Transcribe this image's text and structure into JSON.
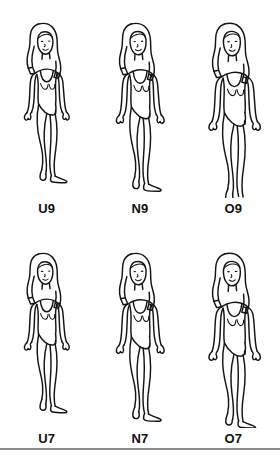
{
  "page": {
    "background_color": "#ffffff",
    "line_color": "#141414",
    "rule_color": "#8a8a8a"
  },
  "grid": {
    "rows": 2,
    "columns": 3
  },
  "rows": [
    {
      "name": "top-row",
      "figures": [
        {
          "label": "U9",
          "category": "underweight",
          "size_number": "9",
          "silhouette": "slim"
        },
        {
          "label": "N9",
          "category": "normal",
          "size_number": "9",
          "silhouette": "average"
        },
        {
          "label": "O9",
          "category": "overweight",
          "size_number": "9",
          "silhouette": "full"
        }
      ]
    },
    {
      "name": "bottom-row",
      "figures": [
        {
          "label": "U7",
          "category": "underweight",
          "size_number": "7",
          "silhouette": "slim"
        },
        {
          "label": "N7",
          "category": "normal",
          "size_number": "7",
          "silhouette": "average"
        },
        {
          "label": "O7",
          "category": "overweight",
          "size_number": "7",
          "silhouette": "full"
        }
      ]
    }
  ],
  "footer": {
    "divider": "horizontal-rule"
  }
}
